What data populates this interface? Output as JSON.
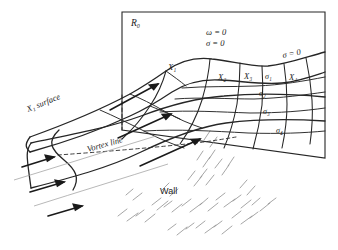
{
  "figure": {
    "region_label": "R₀",
    "wall_label": "Wall",
    "surface_label": "X₁ surface",
    "vortex_label": "Vortex line",
    "conditions": {
      "omega": "ω = 0",
      "sigma": "σ = 0",
      "sigma_right": "σ = 0"
    },
    "x_stations": [
      {
        "id": "x1",
        "label": "X₁",
        "x": 168,
        "y": 70
      },
      {
        "id": "x2",
        "label": "X₂",
        "x": 218,
        "y": 80
      },
      {
        "id": "x3",
        "label": "X₃",
        "x": 248,
        "y": 77
      },
      {
        "id": "x4",
        "label": "X₄",
        "x": 291,
        "y": 80
      }
    ],
    "sigma_lines": [
      {
        "id": "s1",
        "label": "σ₁",
        "x": 267,
        "y": 78
      },
      {
        "id": "s2",
        "label": "σ₂",
        "x": 262,
        "y": 95
      },
      {
        "id": "s3",
        "label": "σ₃",
        "x": 265,
        "y": 113
      },
      {
        "id": "s4",
        "label": "σ₄",
        "x": 278,
        "y": 132
      }
    ],
    "colors": {
      "ink": "#1a1a1a",
      "line": "#262626",
      "hatch": "#8a8a8a",
      "background": "#ffffff"
    },
    "counts": {
      "inflow_arrows": 3,
      "interior_arrows": 3,
      "x_stations": 4,
      "sigma_lines": 4
    }
  }
}
